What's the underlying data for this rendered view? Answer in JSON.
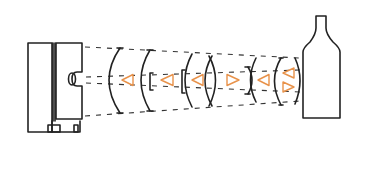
{
  "diagram": {
    "type": "optical-schematic",
    "colors": {
      "ink": "#222222",
      "accent_triangles": "#e8924a",
      "background": "#ffffff"
    },
    "components": [
      {
        "name": "source-housing",
        "label": ""
      },
      {
        "name": "lens-group",
        "count": 9
      },
      {
        "name": "direction-markers",
        "count": 7
      },
      {
        "name": "bottle-target",
        "label": ""
      }
    ],
    "triangle_directions": [
      "left",
      "right",
      "left",
      "right",
      "left",
      "left",
      "right"
    ]
  }
}
